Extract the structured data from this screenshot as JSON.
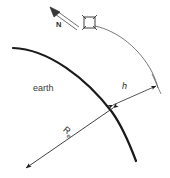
{
  "figure": {
    "background_color": "#ffffff",
    "ink_color": "#1a1a1a",
    "labels": {
      "earth": "earth",
      "altitude": "h",
      "earth_radius_symbol": "R",
      "earth_radius_subscript": "e",
      "north": "N"
    },
    "icons": {
      "satellite": "satellite-icon",
      "north_arrow": "north-arrow-icon",
      "earth_surface": "earth-surface-arc",
      "orbit": "orbit-arc",
      "radius": "earth-radius-arrow",
      "altitude_dimension": "altitude-dimension-arrow"
    }
  }
}
